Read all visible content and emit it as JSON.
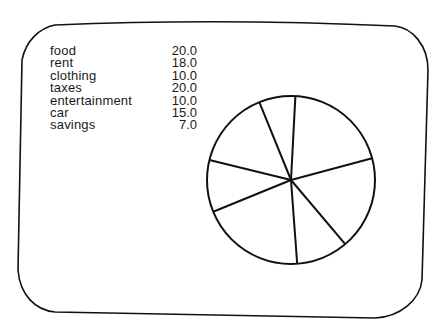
{
  "chart_data": {
    "type": "pie",
    "title": "",
    "categories": [
      "food",
      "rent",
      "clothing",
      "taxes",
      "entertainment",
      "car",
      "savings"
    ],
    "values": [
      20.0,
      18.0,
      10.0,
      20.0,
      10.0,
      15.0,
      7.0
    ],
    "value_labels": [
      "20.0",
      "18.0",
      "10.0",
      "20.0",
      "10.0",
      "15.0",
      "7.0"
    ],
    "legend_position": "top-left",
    "colors": {
      "stroke": "#111111",
      "fill": "#ffffff",
      "text": "#1a1a1a"
    }
  },
  "legend": {
    "items": [
      {
        "label": "food",
        "value": "20.0"
      },
      {
        "label": "rent",
        "value": "18.0"
      },
      {
        "label": "clothing",
        "value": "10.0"
      },
      {
        "label": "taxes",
        "value": "20.0"
      },
      {
        "label": "entertainment",
        "value": "10.0"
      },
      {
        "label": "car",
        "value": "15.0"
      },
      {
        "label": "savings",
        "value": "7.0"
      }
    ]
  }
}
